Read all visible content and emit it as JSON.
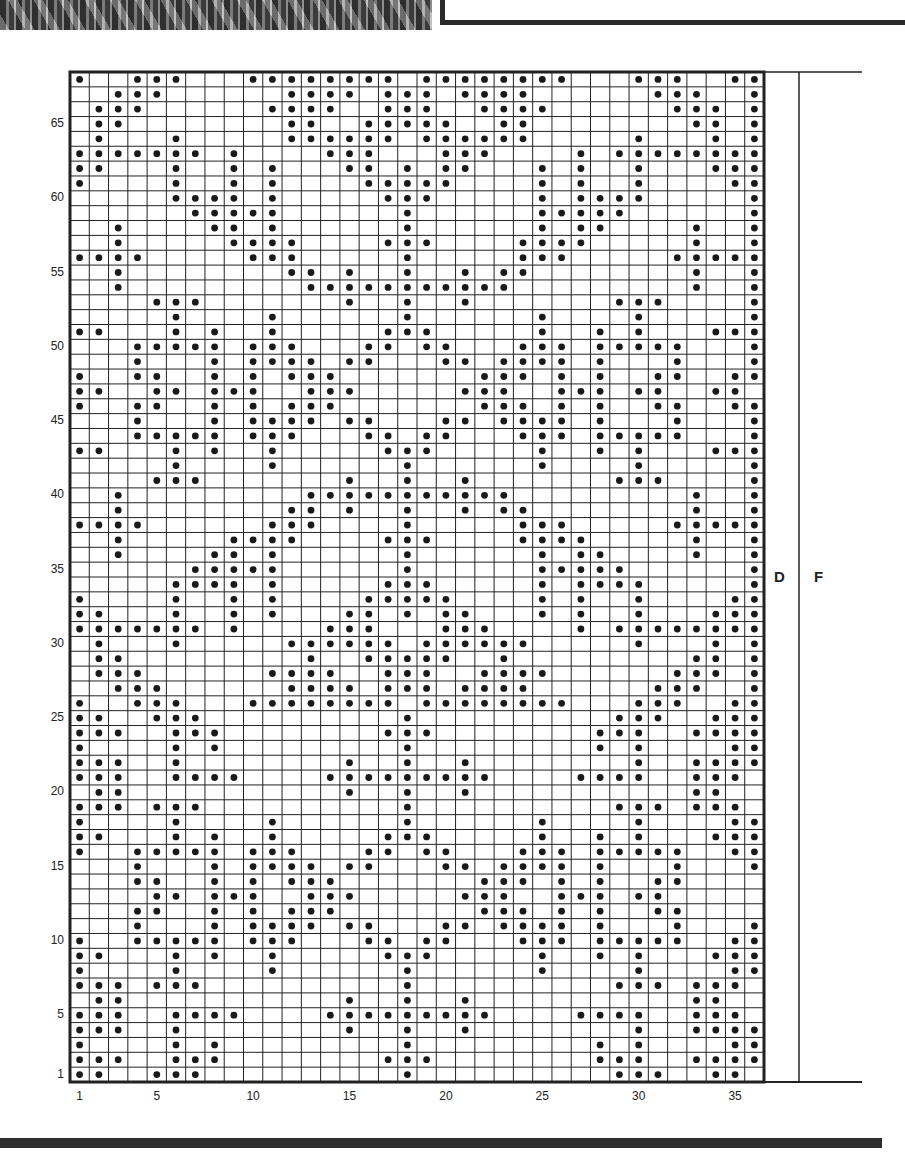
{
  "chart": {
    "columns": 36,
    "rows": 68,
    "row_labels": [
      "1",
      "5",
      "10",
      "15",
      "20",
      "25",
      "30",
      "35",
      "40",
      "45",
      "50",
      "55",
      "60",
      "65"
    ],
    "col_labels": [
      "1",
      "5",
      "10",
      "15",
      "20",
      "25",
      "30",
      "35"
    ],
    "side_labels": {
      "d": "D",
      "f": "F"
    },
    "colors": {
      "grid": "#222222",
      "dot": "#1a1a1a",
      "background": "#ffffff"
    }
  },
  "chart_data": {
    "type": "heatmap",
    "xlabel": "Stitch",
    "ylabel": "Row",
    "x_range": [
      1,
      36
    ],
    "y_range": [
      1,
      68
    ],
    "grid": true,
    "dots_by_row": {
      "68": [
        1,
        4,
        5,
        6,
        10,
        11,
        12,
        13,
        14,
        15,
        16,
        17,
        19,
        20,
        21,
        22,
        23,
        24,
        25,
        26,
        30,
        31,
        32,
        35,
        36
      ],
      "67": [
        3,
        4,
        5,
        12,
        13,
        14,
        15,
        17,
        18,
        19,
        21,
        22,
        23,
        24,
        31,
        32,
        33,
        36
      ],
      "66": [
        2,
        3,
        4,
        11,
        12,
        13,
        14,
        17,
        18,
        19,
        22,
        23,
        24,
        25,
        32,
        33,
        34,
        36
      ],
      "65": [
        2,
        3,
        12,
        13,
        16,
        17,
        18,
        19,
        20,
        23,
        24,
        33,
        34,
        36
      ],
      "64": [
        2,
        6,
        12,
        13,
        14,
        15,
        16,
        17,
        19,
        20,
        21,
        22,
        23,
        24,
        30,
        34,
        36
      ],
      "63": [
        1,
        2,
        3,
        4,
        5,
        6,
        7,
        9,
        14,
        15,
        16,
        20,
        21,
        22,
        27,
        29,
        30,
        31,
        32,
        33,
        34,
        35,
        36
      ],
      "62": [
        1,
        2,
        6,
        9,
        11,
        15,
        16,
        18,
        20,
        21,
        25,
        27,
        30,
        34,
        35,
        36
      ],
      "61": [
        1,
        6,
        9,
        11,
        16,
        17,
        18,
        19,
        20,
        25,
        27,
        30,
        35,
        36
      ],
      "60": [
        6,
        7,
        8,
        9,
        11,
        17,
        18,
        19,
        25,
        27,
        28,
        29,
        30,
        36
      ],
      "59": [
        7,
        8,
        9,
        10,
        11,
        18,
        25,
        26,
        27,
        28,
        29,
        36
      ],
      "58": [
        3,
        8,
        9,
        11,
        18,
        25,
        27,
        28,
        33,
        36
      ],
      "57": [
        3,
        9,
        10,
        11,
        12,
        17,
        18,
        19,
        24,
        25,
        26,
        27,
        33,
        36
      ],
      "56": [
        1,
        2,
        3,
        4,
        10,
        11,
        12,
        18,
        24,
        25,
        26,
        32,
        33,
        34,
        35,
        36
      ],
      "55": [
        3,
        12,
        13,
        15,
        18,
        21,
        23,
        24,
        33,
        36
      ],
      "54": [
        3,
        13,
        14,
        15,
        16,
        17,
        18,
        19,
        20,
        21,
        22,
        23,
        33,
        36
      ],
      "53": [
        5,
        6,
        7,
        15,
        18,
        21,
        29,
        30,
        31,
        36
      ],
      "52": [
        6,
        11,
        18,
        25,
        30,
        36
      ],
      "51": [
        1,
        2,
        6,
        8,
        11,
        17,
        18,
        19,
        25,
        28,
        30,
        34,
        35,
        36
      ],
      "50": [
        4,
        5,
        6,
        7,
        8,
        10,
        11,
        12,
        16,
        17,
        19,
        20,
        24,
        25,
        26,
        28,
        29,
        30,
        31,
        32,
        36
      ],
      "49": [
        4,
        8,
        10,
        11,
        12,
        13,
        15,
        16,
        20,
        21,
        23,
        24,
        25,
        26,
        28,
        32,
        36
      ],
      "48": [
        1,
        4,
        5,
        8,
        10,
        12,
        13,
        14,
        22,
        23,
        24,
        26,
        28,
        31,
        32,
        35,
        36
      ],
      "47": [
        1,
        2,
        5,
        6,
        8,
        9,
        10,
        13,
        14,
        15,
        21,
        22,
        23,
        26,
        27,
        28,
        30,
        31,
        34,
        35
      ],
      "46": [
        1,
        4,
        5,
        8,
        10,
        12,
        13,
        14,
        22,
        23,
        24,
        26,
        28,
        31,
        32,
        35,
        36
      ],
      "45": [
        4,
        8,
        10,
        11,
        12,
        13,
        15,
        16,
        20,
        21,
        23,
        24,
        25,
        26,
        28,
        32,
        36
      ],
      "44": [
        4,
        5,
        6,
        7,
        8,
        10,
        11,
        12,
        16,
        17,
        19,
        20,
        24,
        25,
        26,
        28,
        29,
        30,
        31,
        32,
        36
      ],
      "43": [
        1,
        2,
        6,
        8,
        11,
        17,
        18,
        19,
        25,
        28,
        30,
        34,
        35,
        36
      ],
      "42": [
        6,
        11,
        18,
        25,
        30,
        36
      ],
      "41": [
        5,
        6,
        7,
        15,
        18,
        21,
        29,
        30,
        31,
        36
      ],
      "40": [
        3,
        13,
        14,
        15,
        16,
        17,
        18,
        19,
        20,
        21,
        22,
        23,
        33,
        36
      ],
      "39": [
        3,
        12,
        13,
        15,
        18,
        21,
        23,
        24,
        33,
        36
      ],
      "38": [
        1,
        2,
        3,
        4,
        11,
        12,
        13,
        18,
        24,
        25,
        26,
        32,
        33,
        34,
        35,
        36
      ],
      "37": [
        3,
        9,
        10,
        11,
        12,
        17,
        18,
        19,
        24,
        25,
        26,
        27,
        33,
        36
      ],
      "36": [
        3,
        8,
        9,
        11,
        18,
        25,
        27,
        28,
        33,
        36
      ],
      "35": [
        7,
        8,
        9,
        10,
        11,
        18,
        25,
        26,
        27,
        28,
        29,
        36
      ],
      "34": [
        6,
        7,
        8,
        9,
        11,
        17,
        18,
        19,
        25,
        27,
        28,
        29,
        30,
        36
      ],
      "33": [
        1,
        6,
        9,
        11,
        16,
        17,
        18,
        19,
        20,
        25,
        27,
        30,
        35,
        36
      ],
      "32": [
        1,
        2,
        6,
        9,
        11,
        15,
        16,
        18,
        20,
        21,
        25,
        27,
        30,
        34,
        35,
        36
      ],
      "31": [
        1,
        2,
        3,
        4,
        5,
        6,
        7,
        9,
        14,
        15,
        16,
        20,
        21,
        22,
        27,
        29,
        30,
        31,
        32,
        33,
        34,
        35,
        36
      ],
      "30": [
        2,
        6,
        12,
        13,
        14,
        15,
        16,
        17,
        19,
        20,
        21,
        22,
        23,
        24,
        30,
        34,
        36
      ],
      "29": [
        2,
        3,
        13,
        16,
        17,
        18,
        19,
        20,
        23,
        33,
        34,
        36
      ],
      "28": [
        2,
        3,
        4,
        11,
        12,
        13,
        14,
        17,
        18,
        19,
        22,
        23,
        24,
        25,
        32,
        33,
        34,
        36
      ],
      "27": [
        3,
        4,
        5,
        12,
        13,
        14,
        15,
        17,
        18,
        19,
        21,
        22,
        23,
        24,
        31,
        32,
        33,
        36
      ],
      "26": [
        1,
        4,
        5,
        6,
        10,
        11,
        12,
        13,
        14,
        15,
        16,
        17,
        19,
        20,
        21,
        22,
        23,
        24,
        25,
        26,
        30,
        31,
        32,
        35,
        36
      ],
      "25": [
        1,
        2,
        5,
        6,
        7,
        18,
        29,
        30,
        31,
        34,
        35,
        36
      ],
      "24": [
        1,
        2,
        3,
        6,
        7,
        8,
        17,
        18,
        19,
        28,
        29,
        30,
        33,
        34,
        35,
        36
      ],
      "23": [
        1,
        6,
        8,
        18,
        28,
        30,
        35,
        36
      ],
      "22": [
        1,
        2,
        3,
        6,
        15,
        18,
        21,
        30,
        33,
        34,
        35,
        36
      ],
      "21": [
        1,
        2,
        3,
        6,
        7,
        8,
        9,
        14,
        15,
        16,
        17,
        18,
        19,
        20,
        21,
        22,
        27,
        28,
        29,
        30,
        33,
        34,
        35
      ],
      "20": [
        2,
        3,
        15,
        18,
        21,
        33,
        34
      ],
      "19": [
        1,
        2,
        3,
        5,
        6,
        7,
        18,
        29,
        30,
        31,
        33,
        34,
        35
      ],
      "18": [
        1,
        6,
        11,
        18,
        25,
        30,
        35,
        36
      ],
      "17": [
        1,
        2,
        6,
        8,
        11,
        17,
        18,
        19,
        25,
        28,
        30,
        34,
        35,
        36
      ],
      "16": [
        1,
        4,
        5,
        6,
        7,
        8,
        10,
        11,
        12,
        16,
        17,
        19,
        20,
        24,
        25,
        26,
        28,
        29,
        30,
        31,
        32,
        35,
        36
      ],
      "15": [
        4,
        8,
        10,
        11,
        12,
        13,
        15,
        16,
        20,
        21,
        23,
        24,
        25,
        26,
        28,
        32,
        36
      ],
      "14": [
        4,
        5,
        8,
        10,
        12,
        13,
        14,
        22,
        23,
        24,
        26,
        28,
        31,
        32
      ],
      "13": [
        5,
        6,
        8,
        9,
        10,
        13,
        14,
        15,
        21,
        22,
        23,
        26,
        27,
        28,
        30,
        31
      ],
      "12": [
        4,
        5,
        8,
        10,
        12,
        13,
        14,
        22,
        23,
        24,
        26,
        28,
        31,
        32
      ],
      "11": [
        4,
        8,
        10,
        11,
        12,
        13,
        15,
        16,
        20,
        21,
        23,
        24,
        25,
        26,
        28,
        32,
        36
      ],
      "10": [
        1,
        4,
        5,
        6,
        7,
        8,
        10,
        11,
        12,
        16,
        17,
        19,
        20,
        24,
        25,
        26,
        28,
        29,
        30,
        31,
        32,
        35,
        36
      ],
      "9": [
        1,
        2,
        6,
        8,
        11,
        17,
        18,
        19,
        25,
        28,
        30,
        34,
        35,
        36
      ],
      "8": [
        1,
        6,
        11,
        18,
        25,
        30,
        35,
        36
      ],
      "7": [
        1,
        2,
        3,
        5,
        6,
        7,
        18,
        29,
        30,
        31,
        33,
        34,
        35
      ],
      "6": [
        2,
        3,
        15,
        18,
        21,
        33,
        34
      ],
      "5": [
        1,
        2,
        3,
        6,
        7,
        8,
        9,
        14,
        15,
        16,
        17,
        18,
        19,
        20,
        21,
        22,
        27,
        28,
        29,
        30,
        33,
        34,
        35
      ],
      "4": [
        1,
        2,
        3,
        6,
        15,
        18,
        21,
        30,
        33,
        34,
        35,
        36
      ],
      "3": [
        1,
        6,
        8,
        18,
        28,
        30,
        35,
        36
      ],
      "2": [
        1,
        2,
        3,
        6,
        7,
        8,
        17,
        18,
        19,
        28,
        29,
        30,
        33,
        34,
        35,
        36
      ],
      "1": [
        1,
        2,
        5,
        6,
        7,
        18,
        29,
        30,
        31,
        34,
        35
      ]
    }
  }
}
